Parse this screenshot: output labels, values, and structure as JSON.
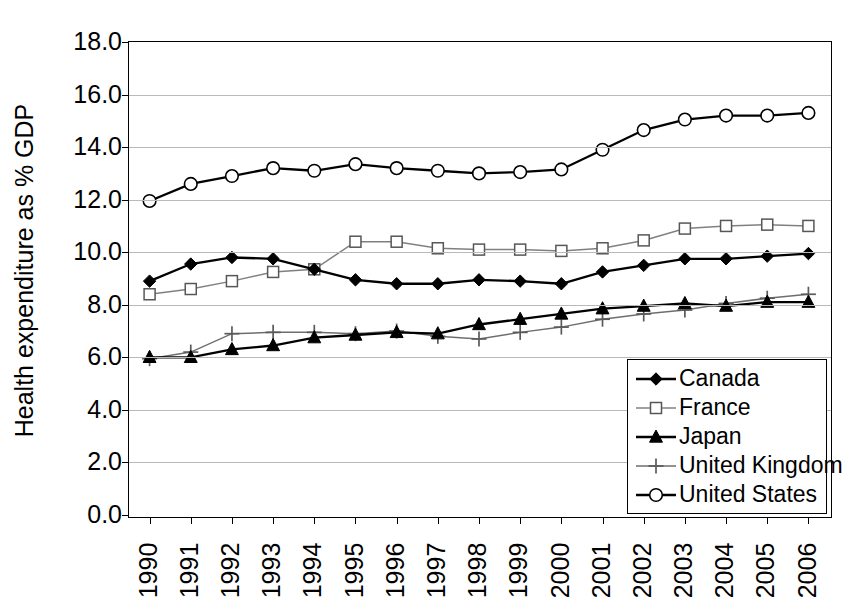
{
  "chart_data": {
    "type": "line",
    "title": "",
    "xlabel": "",
    "ylabel": "Health expenditure as % GDP",
    "x": [
      1990,
      1991,
      1992,
      1993,
      1994,
      1995,
      1996,
      1997,
      1998,
      1999,
      2000,
      2001,
      2002,
      2003,
      2004,
      2005,
      2006
    ],
    "xtick_labels": [
      "1990",
      "1991",
      "1992",
      "1993",
      "1994",
      "1995",
      "1996",
      "1997",
      "1998",
      "1999",
      "2000",
      "2001",
      "2002",
      "2003",
      "2004",
      "2005",
      "2006"
    ],
    "ylim": [
      0.0,
      18.0
    ],
    "ytick_labels": [
      "18.0",
      "16.0",
      "14.0",
      "12.0",
      "10.0",
      "8.0",
      "6.0",
      "4.0",
      "2.0",
      "0.0"
    ],
    "ytick_values": [
      18.0,
      16.0,
      14.0,
      12.0,
      10.0,
      8.0,
      6.0,
      4.0,
      2.0,
      0.0
    ],
    "grid": true,
    "legend_position": "bottom-right",
    "series": [
      {
        "name": "Canada",
        "marker": "filled-diamond",
        "color": "#000000",
        "values": [
          8.9,
          9.55,
          9.8,
          9.75,
          9.35,
          8.95,
          8.8,
          8.8,
          8.95,
          8.9,
          8.8,
          9.25,
          9.5,
          9.75,
          9.75,
          9.85,
          9.95
        ]
      },
      {
        "name": "France",
        "marker": "open-square",
        "color": "#808080",
        "values": [
          8.4,
          8.6,
          8.9,
          9.25,
          9.35,
          10.4,
          10.4,
          10.15,
          10.1,
          10.1,
          10.05,
          10.15,
          10.45,
          10.9,
          11.0,
          11.05,
          11.0
        ]
      },
      {
        "name": "Japan",
        "marker": "filled-triangle",
        "color": "#000000",
        "values": [
          6.0,
          6.0,
          6.3,
          6.45,
          6.75,
          6.85,
          6.95,
          6.9,
          7.25,
          7.45,
          7.65,
          7.85,
          7.95,
          8.05,
          7.95,
          8.1,
          8.1
        ]
      },
      {
        "name": "United Kingdom",
        "marker": "plus",
        "color": "#6e6e6e",
        "values": [
          5.95,
          6.2,
          6.9,
          6.95,
          6.95,
          6.9,
          7.0,
          6.8,
          6.7,
          6.95,
          7.15,
          7.45,
          7.65,
          7.8,
          8.05,
          8.25,
          8.4
        ]
      },
      {
        "name": "United States",
        "marker": "open-circle",
        "color": "#000000",
        "values": [
          11.95,
          12.6,
          12.9,
          13.2,
          13.1,
          13.35,
          13.2,
          13.1,
          13.0,
          13.05,
          13.15,
          13.9,
          14.65,
          15.05,
          15.2,
          15.2,
          15.3
        ]
      }
    ]
  },
  "legend": {
    "items": [
      {
        "label": "Canada",
        "marker": "filled-diamond"
      },
      {
        "label": "France",
        "marker": "open-square"
      },
      {
        "label": "Japan",
        "marker": "filled-triangle"
      },
      {
        "label": "United Kingdom",
        "marker": "plus"
      },
      {
        "label": "United States",
        "marker": "open-circle"
      }
    ]
  }
}
